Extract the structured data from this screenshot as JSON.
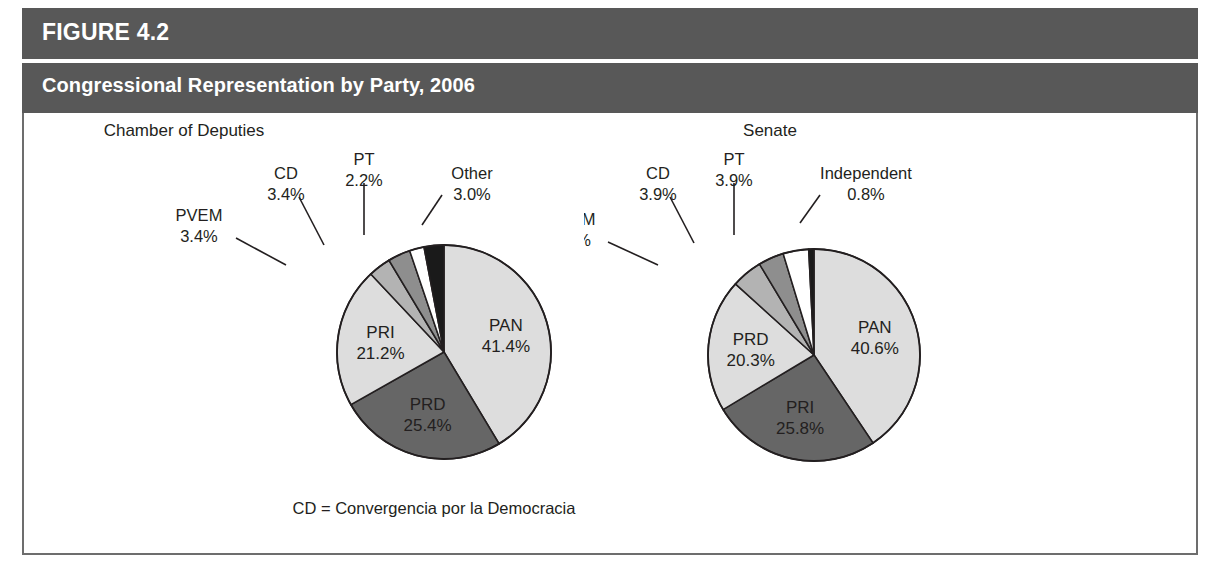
{
  "figure": {
    "number_label": "FIGURE 4.2",
    "title": "Congressional Representation by Party, 2006",
    "footnote": "CD = Convergencia por la Democracia",
    "header_color": "#585858",
    "frame_color": "#6d6d6d",
    "text_color": "#231f20"
  },
  "chart_data": [
    {
      "type": "pie",
      "title": "Chamber of Deputies",
      "units": "percent",
      "start_angle_deg": 0,
      "direction": "clockwise",
      "total": 100.0,
      "categories": [
        "PAN",
        "PRD",
        "PRI",
        "PVEM",
        "CD",
        "PT",
        "Other"
      ],
      "values": [
        41.4,
        25.4,
        21.2,
        3.4,
        3.4,
        2.2,
        3.0
      ],
      "labels": [
        "41.4%",
        "25.4%",
        "21.2%",
        "3.4%",
        "3.4%",
        "2.2%",
        "3.0%"
      ],
      "colors": [
        "#dddddd",
        "#666666",
        "#dddddd",
        "#b3b3b3",
        "#8e8e8e",
        "#ffffff",
        "#1a1a1a"
      ],
      "label_placement": [
        "inside",
        "inside",
        "inside",
        "outside",
        "outside",
        "outside",
        "outside"
      ],
      "legend": "none",
      "grid": false
    },
    {
      "type": "pie",
      "title": "Senate",
      "units": "percent",
      "start_angle_deg": 0,
      "direction": "clockwise",
      "total": 100.0,
      "categories": [
        "PAN",
        "PRI",
        "PRD",
        "PVEM",
        "CD",
        "PT",
        "Independent"
      ],
      "values": [
        40.6,
        25.8,
        20.3,
        4.7,
        3.9,
        3.9,
        0.8
      ],
      "labels": [
        "40.6%",
        "25.8%",
        "20.3%",
        "4.7%",
        "3.9%",
        "3.9%",
        "0.8%"
      ],
      "colors": [
        "#dddddd",
        "#666666",
        "#dddddd",
        "#b3b3b3",
        "#8e8e8e",
        "#ffffff",
        "#1a1a1a"
      ],
      "label_placement": [
        "inside",
        "inside",
        "inside",
        "outside",
        "outside",
        "outside",
        "outside"
      ],
      "legend": "none",
      "grid": false
    }
  ],
  "geometry": {
    "deputies": {
      "cx": 420,
      "cy": 239,
      "r": 107
    },
    "senate": {
      "cx": 230,
      "cy": 242,
      "r": 106
    }
  },
  "outer_labels": {
    "deputies": [
      {
        "name": "PVEM",
        "pct": "3.4%",
        "tx": 175,
        "ty": 108,
        "lx1": 212,
        "ly1": 125,
        "lx2": 262,
        "ly2": 152
      },
      {
        "name": "CD",
        "pct": "3.4%",
        "tx": 262,
        "ty": 66,
        "lx1": 275,
        "ly1": 84,
        "lx2": 300,
        "ly2": 132
      },
      {
        "name": "PT",
        "pct": "2.2%",
        "tx": 340,
        "ty": 52,
        "lx1": 340,
        "ly1": 70,
        "lx2": 340,
        "ly2": 122
      },
      {
        "name": "Other",
        "pct": "3.0%",
        "tx": 448,
        "ty": 66,
        "lx1": 418,
        "ly1": 82,
        "lx2": 398,
        "ly2": 112
      }
    ],
    "senate": [
      {
        "name": "PVEM",
        "pct": "4.7%",
        "tx": -12,
        "ty": 112,
        "lx1": 24,
        "ly1": 129,
        "lx2": 74,
        "ly2": 152
      },
      {
        "name": "CD",
        "pct": "3.9%",
        "tx": 74,
        "ty": 66,
        "lx1": 86,
        "ly1": 84,
        "lx2": 110,
        "ly2": 130
      },
      {
        "name": "PT",
        "pct": "3.9%",
        "tx": 150,
        "ty": 52,
        "lx1": 150,
        "ly1": 70,
        "lx2": 150,
        "ly2": 122
      },
      {
        "name": "Independent",
        "pct": "0.8%",
        "tx": 282,
        "ty": 66,
        "lx1": 236,
        "ly1": 82,
        "lx2": 216,
        "ly2": 110
      }
    ]
  }
}
